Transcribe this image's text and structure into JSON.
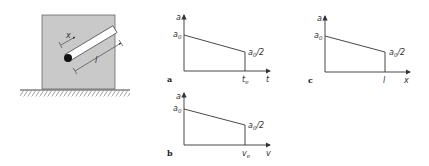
{
  "diagram": {
    "apparatus": {
      "rod_labels": {
        "x": "x",
        "l": "l"
      }
    },
    "panels": [
      {
        "id": "a",
        "label": "a",
        "y_axis": "a",
        "x_axis": "t",
        "y_start": "a0",
        "y_end": "a0/2",
        "x_end": "t_e"
      },
      {
        "id": "b",
        "label": "b",
        "y_axis": "a",
        "x_axis": "v",
        "y_start": "a0",
        "y_end": "a0/2",
        "x_end": "v_e"
      },
      {
        "id": "c",
        "label": "c",
        "y_axis": "a",
        "x_axis": "x",
        "y_start": "a0",
        "y_end": "a0/2",
        "x_end": "l"
      }
    ],
    "text": {
      "a": "a",
      "a0": "a",
      "a0_sub": "0",
      "half": "/2",
      "te": "t",
      "te_sub": "e",
      "t": "t",
      "ve": "v",
      "ve_sub": "e",
      "v": "v",
      "l": "l",
      "x": "x",
      "panel_a": "a",
      "panel_b": "b",
      "panel_c": "c",
      "rod_x": "x",
      "rod_l": "l"
    }
  }
}
